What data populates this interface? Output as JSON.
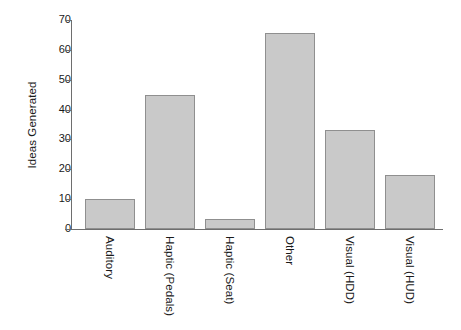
{
  "chart_data": {
    "type": "bar",
    "title": "",
    "xlabel": "",
    "ylabel": "Ideas Generated",
    "categories": [
      "Auditory",
      "Haptic (Pedals)",
      "Haptic (Seat)",
      "Other",
      "Visual (HDD)",
      "Visual (HUD)"
    ],
    "values": [
      10,
      45,
      3.5,
      65.5,
      33,
      18
    ],
    "ylim": [
      0,
      70
    ],
    "yticks": [
      0,
      10,
      20,
      30,
      40,
      50,
      60,
      70
    ],
    "ytick_labels": [
      "0",
      "10",
      "20",
      "30",
      "40",
      "50",
      "60",
      "70"
    ],
    "grid": false,
    "legend": null,
    "bar_fill_color": "#c9c9c9",
    "bar_edge_color": "#8f8f8f",
    "axis_color": "#6e6e6e",
    "text_color": "#1a1a1a"
  }
}
